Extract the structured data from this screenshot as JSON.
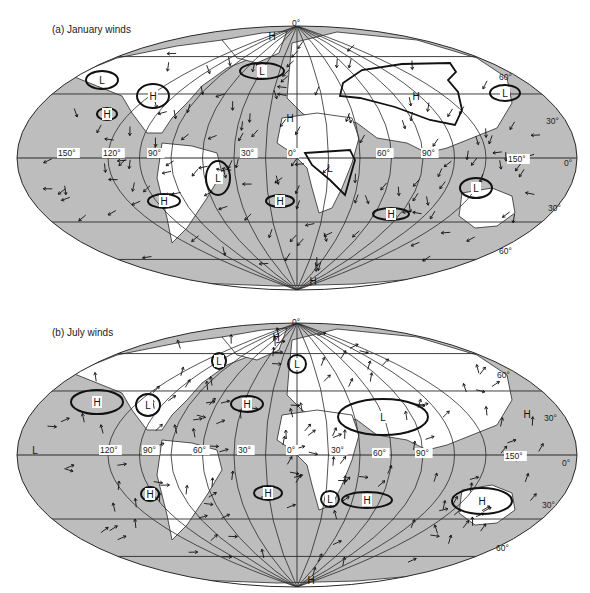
{
  "figure": {
    "panels": [
      {
        "id": "a",
        "title": "(a) January winds",
        "ellipse": {
          "cx": 297,
          "cy": 158,
          "rx": 280,
          "ry": 132
        },
        "top_label": {
          "text": "0°",
          "x": 292,
          "y": 26
        },
        "lon_labels": [
          {
            "text": "150°",
            "x": 58,
            "y": 156
          },
          {
            "text": "120°",
            "x": 103,
            "y": 156
          },
          {
            "text": "90°",
            "x": 148,
            "y": 156
          },
          {
            "text": "30°",
            "x": 241,
            "y": 156
          },
          {
            "text": "0°",
            "x": 288,
            "y": 156
          },
          {
            "text": "60°",
            "x": 377,
            "y": 156
          },
          {
            "text": "90°",
            "x": 422,
            "y": 156
          },
          {
            "text": "150°",
            "x": 508,
            "y": 162
          }
        ],
        "lat_labels": [
          {
            "text": "60°",
            "x": 499,
            "y": 80
          },
          {
            "text": "30°",
            "x": 546,
            "y": 124
          },
          {
            "text": "0°",
            "x": 564,
            "y": 166
          },
          {
            "text": "30°",
            "x": 548,
            "y": 211
          },
          {
            "text": "60°",
            "x": 499,
            "y": 254
          }
        ],
        "pressure_centers": [
          {
            "type": "H",
            "x": 272,
            "y": 36,
            "ring": false
          },
          {
            "type": "L",
            "x": 102,
            "y": 80,
            "ring": true,
            "rx": 16,
            "ry": 9
          },
          {
            "type": "L",
            "x": 262,
            "y": 71,
            "ring": true,
            "rx": 22,
            "ry": 8
          },
          {
            "type": "H",
            "x": 153,
            "y": 96,
            "ring": true,
            "rx": 16,
            "ry": 12
          },
          {
            "type": "H",
            "x": 107,
            "y": 114,
            "ring": true,
            "rx": 10,
            "ry": 6
          },
          {
            "type": "H",
            "x": 290,
            "y": 118,
            "ring": false
          },
          {
            "type": "H",
            "x": 416,
            "y": 96,
            "ring": false
          },
          {
            "type": "L",
            "x": 505,
            "y": 93,
            "ring": true,
            "rx": 15,
            "ry": 8
          },
          {
            "type": "L",
            "x": 218,
            "y": 178,
            "ring": true,
            "rx": 12,
            "ry": 17
          },
          {
            "type": "L",
            "x": 330,
            "y": 168,
            "ring": false
          },
          {
            "type": "H",
            "x": 164,
            "y": 201,
            "ring": true,
            "rx": 16,
            "ry": 7
          },
          {
            "type": "H",
            "x": 280,
            "y": 201,
            "ring": true,
            "rx": 14,
            "ry": 6
          },
          {
            "type": "H",
            "x": 391,
            "y": 214,
            "ring": true,
            "rx": 18,
            "ry": 6
          },
          {
            "type": "L",
            "x": 476,
            "y": 188,
            "ring": true,
            "rx": 16,
            "ry": 10
          },
          {
            "type": "H",
            "x": 313,
            "y": 281,
            "ring": false
          }
        ],
        "outlines": [
          {
            "name": "asian-high-outline",
            "points": "343,83 362,70 402,64 450,63 456,72 448,80 458,92 462,110 455,125 430,120 395,107 360,98 340,96"
          },
          {
            "name": "africa-low-outline",
            "points": "305,153 350,150 355,160 345,195 330,180 312,165"
          }
        ]
      },
      {
        "id": "b",
        "title": "(b) July winds",
        "ellipse": {
          "cx": 297,
          "cy": 455,
          "rx": 280,
          "ry": 132
        },
        "top_label": {
          "text": "0°",
          "x": 292,
          "y": 325
        },
        "lon_labels": [
          {
            "text": "120°",
            "x": 100,
            "y": 453
          },
          {
            "text": "90°",
            "x": 143,
            "y": 453
          },
          {
            "text": "60°",
            "x": 193,
            "y": 453
          },
          {
            "text": "30°",
            "x": 238,
            "y": 453
          },
          {
            "text": "0°",
            "x": 287,
            "y": 453
          },
          {
            "text": "30°",
            "x": 331,
            "y": 453
          },
          {
            "text": "60°",
            "x": 373,
            "y": 456
          },
          {
            "text": "90°",
            "x": 416,
            "y": 456
          },
          {
            "text": "150°",
            "x": 505,
            "y": 459
          }
        ],
        "lat_labels": [
          {
            "text": "60°",
            "x": 497,
            "y": 378
          },
          {
            "text": "30°",
            "x": 544,
            "y": 421
          },
          {
            "text": "0°",
            "x": 562,
            "y": 466
          },
          {
            "text": "30°",
            "x": 542,
            "y": 508
          },
          {
            "text": "60°",
            "x": 496,
            "y": 551
          }
        ],
        "pressure_centers": [
          {
            "type": "H",
            "x": 276,
            "y": 337,
            "ring": false
          },
          {
            "type": "L",
            "x": 219,
            "y": 361,
            "ring": true,
            "rx": 7,
            "ry": 8
          },
          {
            "type": "L",
            "x": 297,
            "y": 364,
            "ring": true,
            "rx": 9,
            "ry": 9
          },
          {
            "type": "H",
            "x": 97,
            "y": 402,
            "ring": true,
            "rx": 26,
            "ry": 12
          },
          {
            "type": "L",
            "x": 148,
            "y": 405,
            "ring": true,
            "rx": 12,
            "ry": 11
          },
          {
            "type": "H",
            "x": 247,
            "y": 404,
            "ring": true,
            "rx": 16,
            "ry": 8
          },
          {
            "type": "L",
            "x": 383,
            "y": 417,
            "ring": true,
            "rx": 45,
            "ry": 18
          },
          {
            "type": "H",
            "x": 527,
            "y": 414,
            "ring": false
          },
          {
            "type": "L",
            "x": 35,
            "y": 450,
            "ring": false
          },
          {
            "type": "H",
            "x": 150,
            "y": 494,
            "ring": true,
            "rx": 9,
            "ry": 7
          },
          {
            "type": "H",
            "x": 268,
            "y": 493,
            "ring": true,
            "rx": 14,
            "ry": 7
          },
          {
            "type": "L",
            "x": 330,
            "y": 499,
            "ring": true,
            "rx": 9,
            "ry": 8
          },
          {
            "type": "H",
            "x": 367,
            "y": 500,
            "ring": true,
            "rx": 25,
            "ry": 8
          },
          {
            "type": "H",
            "x": 482,
            "y": 501,
            "ring": true,
            "rx": 30,
            "ry": 13
          },
          {
            "type": "H",
            "x": 311,
            "y": 580,
            "ring": false
          }
        ],
        "outlines": []
      }
    ],
    "colors": {
      "ocean": "#bdbdbd",
      "land": "#ffffff",
      "lines": "#2a2a2a",
      "ink": "#111111"
    }
  }
}
